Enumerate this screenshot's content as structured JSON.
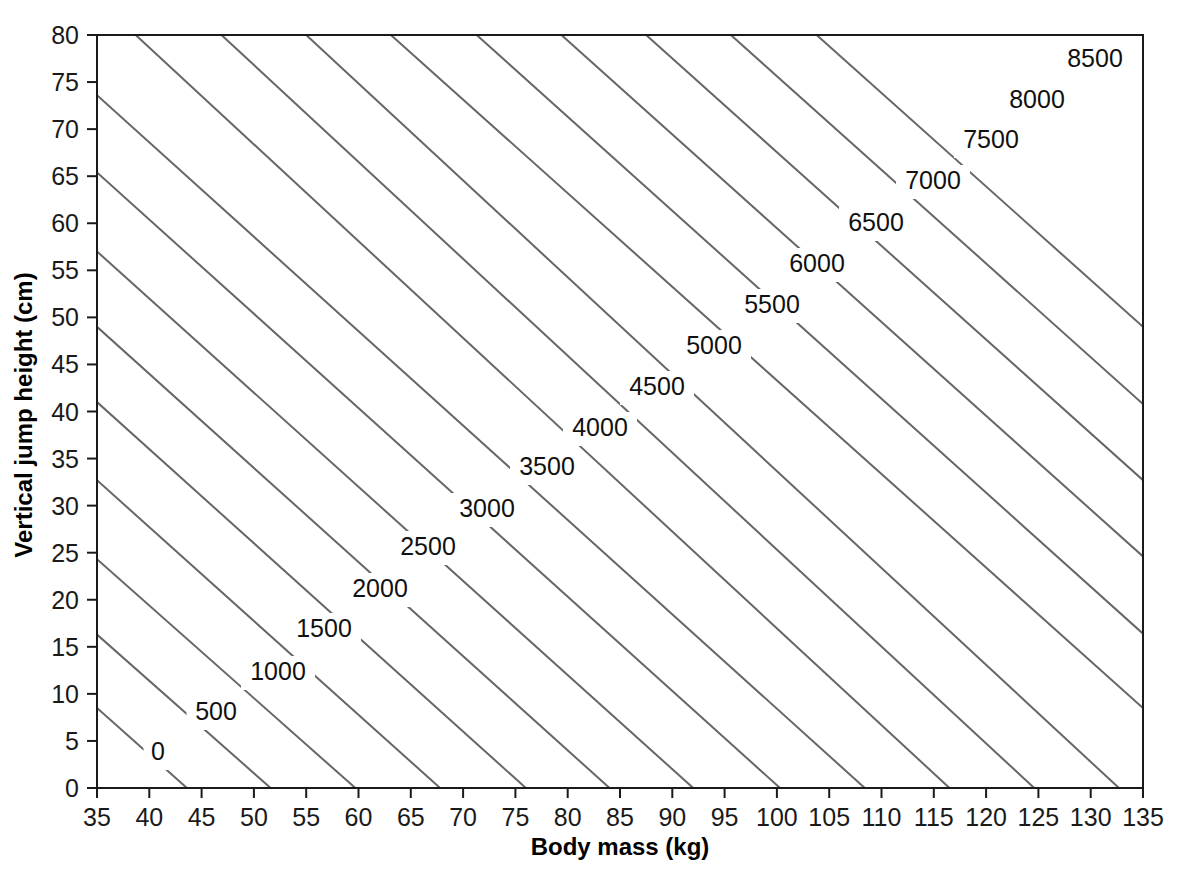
{
  "chart_data": {
    "type": "line",
    "subtype": "contour",
    "title": "",
    "xlabel": "Body mass (kg)",
    "ylabel": "Vertical jump height (cm)",
    "xlim": [
      35,
      135
    ],
    "ylim": [
      0,
      80
    ],
    "xticks": [
      35,
      40,
      45,
      50,
      55,
      60,
      65,
      70,
      75,
      80,
      85,
      90,
      95,
      100,
      105,
      110,
      115,
      120,
      125,
      130,
      135
    ],
    "yticks": [
      0,
      5,
      10,
      15,
      20,
      25,
      30,
      35,
      40,
      45,
      50,
      55,
      60,
      65,
      70,
      75,
      80
    ],
    "xtick_labels": [
      "35",
      "40",
      "45",
      "50",
      "55",
      "60",
      "65",
      "70",
      "75",
      "80",
      "85",
      "90",
      "95",
      "100",
      "105",
      "110",
      "115",
      "120",
      "125",
      "130",
      "135"
    ],
    "ytick_labels": [
      "0",
      "5",
      "10",
      "15",
      "20",
      "25",
      "30",
      "35",
      "40",
      "45",
      "50",
      "55",
      "60",
      "65",
      "70",
      "75",
      "80"
    ],
    "grid": false,
    "legend": "none",
    "contour_interval": 500,
    "contour_levels": [
      0,
      500,
      1000,
      1500,
      2000,
      2500,
      3000,
      3500,
      4000,
      4500,
      5000,
      5500,
      6000,
      6500,
      7000,
      7500,
      8000,
      8500
    ],
    "contour_line_color": "#666666",
    "axis_color": "#1a1a1a",
    "background_color": "#ffffff",
    "contours": [
      {
        "level": 0,
        "label": "0",
        "x1": 35,
        "y1": 8.5,
        "x2": 43.6,
        "y2": 0,
        "label_x": 40.0,
        "label_y": 5.0
      },
      {
        "level": 500,
        "label": "500",
        "x1": 35,
        "y1": 16.3,
        "x2": 51.6,
        "y2": 0,
        "label_x": 46.4,
        "label_y": 10.6
      },
      {
        "level": 1000,
        "label": "1000",
        "x1": 35,
        "y1": 24.3,
        "x2": 59.7,
        "y2": 0,
        "label_x": 54.0,
        "label_y": 16.2
      },
      {
        "level": 1500,
        "label": "1500",
        "x1": 35,
        "y1": 32.7,
        "x2": 67.8,
        "y2": 0,
        "label_x": 61.4,
        "label_y": 21.6
      },
      {
        "level": 2000,
        "label": "2000",
        "x1": 35,
        "y1": 41.0,
        "x2": 76.0,
        "y2": 0,
        "label_x": 68.6,
        "label_y": 26.7
      },
      {
        "level": 2500,
        "label": "2500",
        "x1": 35,
        "y1": 49.0,
        "x2": 84.0,
        "y2": 0,
        "label_x": 76.0,
        "label_y": 32.0
      },
      {
        "level": 3000,
        "label": "3000",
        "x1": 35,
        "y1": 57.0,
        "x2": 92.0,
        "y2": 0,
        "label_x": 83.4,
        "label_y": 37.3
      },
      {
        "level": 3500,
        "label": "3500",
        "x1": 35,
        "y1": 65.4,
        "x2": 100.3,
        "y2": 0,
        "label_x": 90.7,
        "label_y": 42.8
      },
      {
        "level": 4000,
        "label": "4000",
        "x1": 35,
        "y1": 73.6,
        "x2": 108.4,
        "y2": 0,
        "label_x": 98.1,
        "label_y": 48.0
      },
      {
        "level": 4500,
        "label": "4500",
        "x1": 38.7,
        "y1": 80.0,
        "x2": 116.5,
        "y2": 0,
        "label_x": 105.4,
        "label_y": 53.4
      },
      {
        "level": 5000,
        "label": "5000",
        "x1": 46.9,
        "y1": 80.0,
        "x2": 124.6,
        "y2": 0,
        "label_x": 112.8,
        "label_y": 58.8
      },
      {
        "level": 5500,
        "label": "5500",
        "x1": 55.0,
        "y1": 80.0,
        "x2": 132.7,
        "y2": 0,
        "label_x": 120.1,
        "label_y": 64.0
      },
      {
        "level": 6000,
        "label": "6000",
        "x1": 63.1,
        "y1": 80.0,
        "x2": 135.0,
        "y2": 8.5,
        "label_x": 127.5,
        "label_y": 69.4
      },
      {
        "level": 6500,
        "label": "6500",
        "x1": 71.3,
        "y1": 80.0,
        "x2": 135.0,
        "y2": 16.4,
        "label_x": 134.8,
        "label_y": 74.7
      },
      {
        "level": 7000,
        "label": "7000",
        "x1": 79.4,
        "y1": 80.0,
        "x2": 135.0,
        "y2": 24.6,
        "label_x": 142.0,
        "label_y": 80.0
      },
      {
        "level": 7500,
        "label": "7500",
        "x1": 87.5,
        "y1": 80.0,
        "x2": 135.0,
        "y2": 32.7,
        "label_x": 149.0,
        "label_y": 85.0
      },
      {
        "level": 8000,
        "label": "8000",
        "x1": 95.6,
        "y1": 80.0,
        "x2": 135.0,
        "y2": 40.8,
        "label_x": 156.0,
        "label_y": 90.0
      },
      {
        "level": 8500,
        "label": "8500",
        "x1": 103.8,
        "y1": 80.0,
        "x2": 135.0,
        "y2": 49.0,
        "label_x": 163.0,
        "label_y": 95.0
      }
    ],
    "contour_label_positions": [
      {
        "level": 0,
        "label": "0",
        "px": 158,
        "py": 753
      },
      {
        "level": 500,
        "label": "500",
        "px": 216,
        "py": 713
      },
      {
        "level": 1000,
        "label": "1000",
        "px": 278,
        "py": 673
      },
      {
        "level": 1500,
        "label": "1500",
        "px": 324,
        "py": 630
      },
      {
        "level": 2000,
        "label": "2000",
        "px": 380,
        "py": 590
      },
      {
        "level": 2500,
        "label": "2500",
        "px": 428,
        "py": 548
      },
      {
        "level": 3000,
        "label": "3000",
        "px": 487,
        "py": 510
      },
      {
        "level": 3500,
        "label": "3500",
        "px": 547,
        "py": 468
      },
      {
        "level": 4000,
        "label": "4000",
        "px": 600,
        "py": 429
      },
      {
        "level": 4500,
        "label": "4500",
        "px": 657,
        "py": 388
      },
      {
        "level": 5000,
        "label": "5000",
        "px": 714,
        "py": 347
      },
      {
        "level": 5500,
        "label": "5500",
        "px": 772,
        "py": 306
      },
      {
        "level": 6000,
        "label": "6000",
        "px": 817,
        "py": 265
      },
      {
        "level": 6500,
        "label": "6500",
        "px": 876,
        "py": 224
      },
      {
        "level": 7000,
        "label": "7000",
        "px": 933,
        "py": 182
      },
      {
        "level": 7500,
        "label": "7500",
        "px": 991,
        "py": 141
      },
      {
        "level": 8000,
        "label": "8000",
        "px": 1037,
        "py": 101
      },
      {
        "level": 8500,
        "label": "8500",
        "px": 1095,
        "py": 60
      }
    ]
  },
  "figure": {
    "axis_titles": {
      "x": "Body mass (kg)",
      "y": "Vertical jump height (cm)"
    }
  }
}
